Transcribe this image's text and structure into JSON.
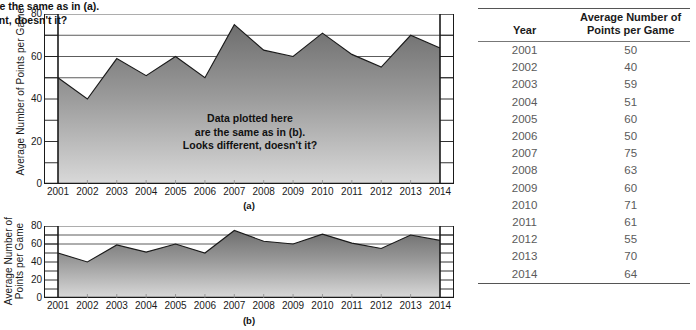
{
  "chart_data": [
    {
      "type": "area",
      "panel": "(a)",
      "title": "",
      "xlabel": "",
      "ylabel": "Average Number of Points per Game",
      "categories": [
        "2001",
        "2002",
        "2003",
        "2004",
        "2005",
        "2006",
        "2007",
        "2008",
        "2009",
        "2010",
        "2011",
        "2012",
        "2013",
        "2014"
      ],
      "values": [
        50,
        40,
        59,
        51,
        60,
        50,
        75,
        63,
        60,
        71,
        61,
        55,
        70,
        64
      ],
      "ylim": [
        0,
        80
      ],
      "ytick_labels": [
        "0",
        "20",
        "40",
        "60",
        "80"
      ],
      "ytick_values": [
        0,
        20,
        40,
        60,
        80
      ],
      "yminor_values": [
        10,
        30,
        50,
        70
      ],
      "grid": "horizontal-above-data",
      "gridline_values": [
        50,
        60,
        70,
        80
      ],
      "annotation": "Data plotted here\nare the same as in (b).\nLooks different, doesn't it?",
      "caption": "(a)",
      "fill_top_color": "#6e6e6e",
      "fill_bottom_color": "#d9d9d9",
      "line_color": "#1a1a1a"
    },
    {
      "type": "area",
      "panel": "(b)",
      "title": "",
      "xlabel": "",
      "ylabel": "Average Number of\nPoints per Game",
      "categories": [
        "2001",
        "2002",
        "2003",
        "2004",
        "2005",
        "2006",
        "2007",
        "2008",
        "2009",
        "2010",
        "2011",
        "2012",
        "2013",
        "2014"
      ],
      "values": [
        50,
        40,
        59,
        51,
        60,
        50,
        75,
        63,
        60,
        71,
        61,
        55,
        70,
        64
      ],
      "ylim": [
        0,
        80
      ],
      "ytick_labels": [
        "0",
        "20",
        "40",
        "60",
        "80"
      ],
      "ytick_values": [
        0,
        20,
        40,
        60,
        80
      ],
      "yminor_values": [
        10,
        30,
        50,
        70
      ],
      "grid": "horizontal-above-data",
      "gridline_values": [
        60,
        70,
        80
      ],
      "annotation": "Data plotted here are the same as in (a).\nLooks different, doesn't it?",
      "caption": "(b)",
      "fill_top_color": "#6e6e6e",
      "fill_bottom_color": "#d9d9d9",
      "line_color": "#1a1a1a"
    }
  ],
  "figure_a": {
    "ylabel": "Average Number of Points per Game",
    "caption": "(a)",
    "annotation_line1": "Data plotted here",
    "annotation_line2": "are the same as in (b).",
    "annotation_line3": "Looks different, doesn't it?"
  },
  "figure_b": {
    "ylabel_line1": "Average Number of",
    "ylabel_line2": "Points per Game",
    "caption": "(b)",
    "annotation_line1": "Data plotted here are the same as in (a).",
    "annotation_line2": "Looks different, doesn't it?"
  },
  "table": {
    "header_year": "Year",
    "header_value_line1": "Average Number of",
    "header_value_line2": "Points per Game",
    "rows": [
      {
        "year": "2001",
        "value": "50"
      },
      {
        "year": "2002",
        "value": "40"
      },
      {
        "year": "2003",
        "value": "59"
      },
      {
        "year": "2004",
        "value": "51"
      },
      {
        "year": "2005",
        "value": "60"
      },
      {
        "year": "2006",
        "value": "50"
      },
      {
        "year": "2007",
        "value": "75"
      },
      {
        "year": "2008",
        "value": "63"
      },
      {
        "year": "2009",
        "value": "60"
      },
      {
        "year": "2010",
        "value": "71"
      },
      {
        "year": "2011",
        "value": "61"
      },
      {
        "year": "2012",
        "value": "55"
      },
      {
        "year": "2013",
        "value": "70"
      },
      {
        "year": "2014",
        "value": "64"
      }
    ]
  },
  "colors": {
    "fill_top": "#6e6e6e",
    "fill_bottom": "#d9d9d9",
    "axis": "#1a1a1a",
    "grid": "#4a4a4a",
    "table_rule": "#555555",
    "table_text": "#5a5a5a"
  }
}
